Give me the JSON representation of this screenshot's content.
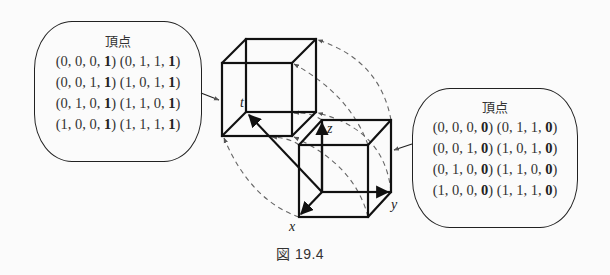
{
  "figure": {
    "caption": "図 19.4",
    "axes": {
      "t": "t",
      "x": "x",
      "y": "y",
      "z": "z"
    }
  },
  "left_bubble": {
    "title": "頂点",
    "rows": [
      {
        "a": "(0, 0, 0, ",
        "a_bold": "1",
        "a_end": ")",
        "b": "(0, 1, 1, ",
        "b_bold": "1",
        "b_end": ")"
      },
      {
        "a": "(0, 0, 1, ",
        "a_bold": "1",
        "a_end": ")",
        "b": "(1, 0, 1, ",
        "b_bold": "1",
        "b_end": ")"
      },
      {
        "a": "(0, 1, 0, ",
        "a_bold": "1",
        "a_end": ")",
        "b": "(1, 1, 0, ",
        "b_bold": "1",
        "b_end": ")"
      },
      {
        "a": "(1, 0, 0, ",
        "a_bold": "1",
        "a_end": ")",
        "b": "(1, 1, 1, ",
        "b_bold": "1",
        "b_end": ")"
      }
    ]
  },
  "right_bubble": {
    "title": "頂点",
    "rows": [
      {
        "a": "(0, 0, 0, ",
        "a_bold": "0",
        "a_end": ")",
        "b": "(0, 1, 1, ",
        "b_bold": "0",
        "b_end": ")"
      },
      {
        "a": "(0, 0, 1, ",
        "a_bold": "0",
        "a_end": ")",
        "b": "(1, 0, 1, ",
        "b_bold": "0",
        "b_end": ")"
      },
      {
        "a": "(0, 1, 0, ",
        "a_bold": "0",
        "a_end": ")",
        "b": "(1, 1, 0, ",
        "b_bold": "0",
        "b_end": ")"
      },
      {
        "a": "(1, 0, 0, ",
        "a_bold": "0",
        "a_end": ")",
        "b": "(1, 1, 1, ",
        "b_bold": "0",
        "b_end": ")"
      }
    ]
  }
}
